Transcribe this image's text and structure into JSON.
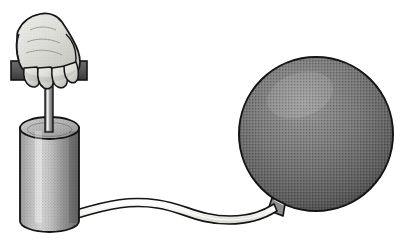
{
  "illustration": {
    "title": "Hand pump inflating a ball",
    "description": "A line-art illustration of a human hand gripping the T-handle of a cylindrical air pump, which is connected by a flexible hose to a large inflated spherical ball.",
    "style": "halftone shaded black-and-white line drawing",
    "background_color": "#ffffff",
    "canvas": {
      "width": 400,
      "height": 240
    }
  },
  "palette": {
    "outline": "#141414",
    "skin_light": "#e8e8e4",
    "skin_mid": "#d2d2cd",
    "skin_shadow": "#b4b4ae",
    "handle_bar_fill": "#5a5a5a",
    "handle_bar_dark": "#3c3c3c",
    "rod_light": "#c8c8c8",
    "rod_mid": "#9a9a9a",
    "rod_dark": "#555555",
    "cylinder_light": "#d8d8d8",
    "cylinder_mid": "#a0a0a0",
    "cylinder_dark": "#6e6e6e",
    "cylinder_top_fill": "#b8b8b8",
    "ball_light": "#8e8e8e",
    "ball_mid": "#6a6a6a",
    "ball_dark": "#4a4a4a",
    "hose_fill": "#f4f4f2",
    "nozzle_fill": "#8c8c8c",
    "white": "#ffffff"
  },
  "parts": {
    "hand": {
      "name": "Hand",
      "label": "hand gripping handle",
      "fill": "#dcdcd8",
      "outline": "#141414"
    },
    "handle_bar": {
      "name": "T-handle",
      "label": "pump T-handle crossbar",
      "fill": "#5a5a5a",
      "left_x": 11,
      "right_x": 87,
      "y": 61,
      "height": 19
    },
    "piston_rod": {
      "name": "Piston rod",
      "label": "pump piston rod",
      "x": 45,
      "top_y": 78,
      "bottom_y": 132,
      "width": 7
    },
    "cylinder": {
      "name": "Pump cylinder",
      "label": "pump barrel",
      "left_x": 20,
      "right_x": 79,
      "top_y": 123,
      "bottom_y": 232,
      "ellipse_ry": 11
    },
    "hose": {
      "name": "Hose",
      "label": "flexible rubber hose",
      "fill": "#f4f4f2",
      "outline": "#141414",
      "start_x": 78,
      "start_y": 214,
      "end_x": 280,
      "end_y": 207
    },
    "nozzle": {
      "name": "Nozzle",
      "label": "inflation nozzle / valve",
      "x": 278,
      "y": 203
    },
    "ball": {
      "name": "Ball",
      "label": "inflated ball",
      "center_x": 316,
      "center_y": 134,
      "radius_x": 77,
      "radius_y": 77,
      "fill": "#6a6a6a",
      "outline": "#141414"
    }
  }
}
